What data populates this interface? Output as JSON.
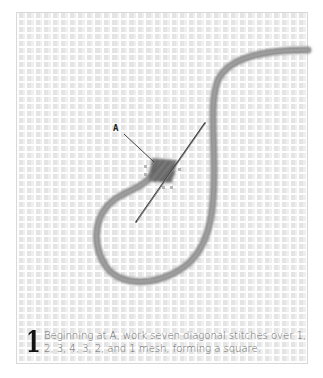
{
  "figure": {
    "label": "A",
    "step": {
      "number": "1",
      "text": "Beginning at A, work seven diagonal stitches over 1, 2, 3, 4, 3, 2, and 1 mesh, forming a square."
    },
    "colors": {
      "yarn": "#8a8a8a",
      "yarn_dark": "#6e6e6e",
      "needle": "#444444",
      "mesh": "#e4e4e4",
      "text": "#6a6a6a",
      "step_number": "#111111"
    }
  }
}
